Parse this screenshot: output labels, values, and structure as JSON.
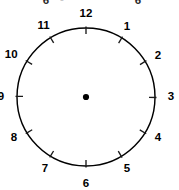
{
  "figure": {
    "kind": "analog-clock-face",
    "canvas": {
      "width": 179,
      "height": 190,
      "background": "#ffffff"
    },
    "stroke_color": "#000000",
    "text_color": "#000000"
  },
  "dial": {
    "center_x": 86,
    "center_y": 97,
    "radius": 69,
    "stroke_width": 1.45
  },
  "center_dot": {
    "name": "center-pivot-dot",
    "radius": 3.1
  },
  "ticks": {
    "count": 12,
    "inward_length": 6,
    "outward_length": 1.5
  },
  "hour_numbers": [
    {
      "label": "12",
      "angle_deg": 0,
      "label_radius": 84,
      "dx": 0,
      "dy": 1
    },
    {
      "label": "1",
      "angle_deg": 30,
      "label_radius": 82,
      "dx": 0,
      "dy": 1
    },
    {
      "label": "2",
      "angle_deg": 60,
      "label_radius": 82,
      "dx": 1,
      "dy": 0
    },
    {
      "label": "3",
      "angle_deg": 90,
      "label_radius": 83,
      "dx": 2,
      "dy": 0
    },
    {
      "label": "4",
      "angle_deg": 120,
      "label_radius": 82,
      "dx": 1,
      "dy": 0
    },
    {
      "label": "5",
      "angle_deg": 150,
      "label_radius": 82,
      "dx": 0,
      "dy": 1
    },
    {
      "label": "6",
      "angle_deg": 180,
      "label_radius": 84,
      "dx": 0,
      "dy": 3
    },
    {
      "label": "7",
      "angle_deg": 210,
      "label_radius": 82,
      "dx": 0,
      "dy": 1
    },
    {
      "label": "8",
      "angle_deg": 240,
      "label_radius": 82,
      "dx": -1,
      "dy": 0
    },
    {
      "label": "9",
      "angle_deg": 270,
      "label_radius": 83,
      "dx": -2,
      "dy": 0
    },
    {
      "label": "10",
      "angle_deg": 300,
      "label_radius": 84,
      "dx": -2,
      "dy": 0
    },
    {
      "label": "11",
      "angle_deg": 330,
      "label_radius": 83,
      "dx": -1,
      "dy": 1
    }
  ],
  "cropped_top_fragments": [
    {
      "glyph": "6",
      "x": 46,
      "baseline_y": 4
    },
    {
      "glyph": "-",
      "x": 62,
      "baseline_y": 2
    },
    {
      "glyph": "6",
      "x": 138,
      "baseline_y": 4
    }
  ]
}
